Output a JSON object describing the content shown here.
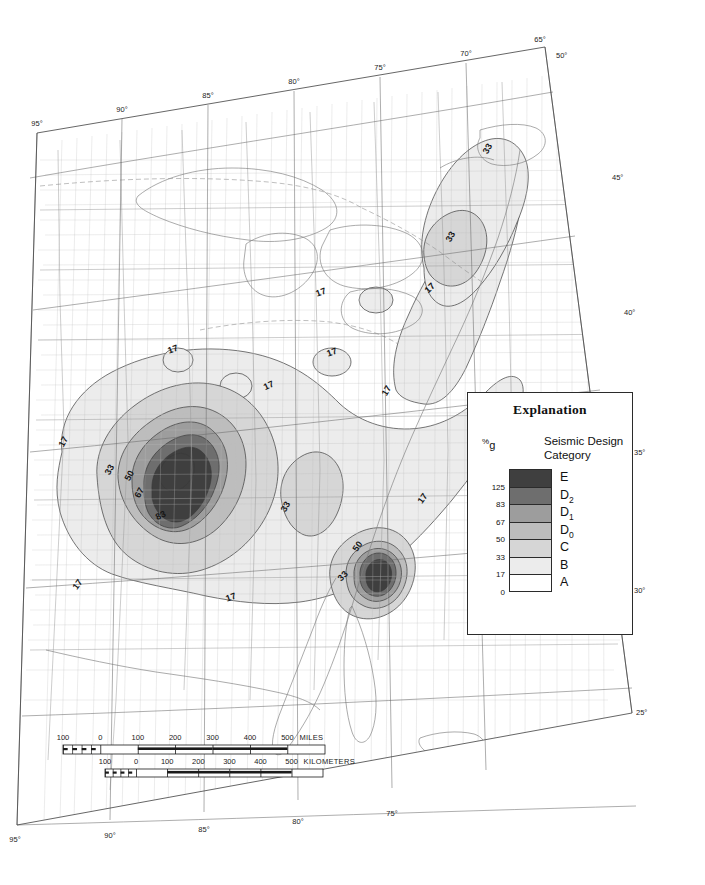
{
  "document": {
    "kind": "seismic-hazard-map",
    "region": "Central and Eastern United States"
  },
  "legend": {
    "title": "Explanation",
    "unit_label_pct": "%",
    "unit_label_g": "g",
    "header_line1": "Seismic Design",
    "header_line2": "Category",
    "entries": [
      {
        "category": "E",
        "sub": "",
        "upper": "",
        "lower": "125",
        "color": "#3f3f3f"
      },
      {
        "category": "D",
        "sub": "2",
        "upper": "125",
        "lower": "83",
        "color": "#6e6e6e"
      },
      {
        "category": "D",
        "sub": "1",
        "upper": "83",
        "lower": "67",
        "color": "#9d9d9d"
      },
      {
        "category": "D",
        "sub": "0",
        "upper": "67",
        "lower": "50",
        "color": "#bdbdbd"
      },
      {
        "category": "C",
        "sub": "",
        "upper": "50",
        "lower": "33",
        "color": "#d6d6d6"
      },
      {
        "category": "B",
        "sub": "",
        "upper": "33",
        "lower": "17",
        "color": "#ececec"
      },
      {
        "category": "A",
        "sub": "",
        "upper": "17",
        "lower": "0",
        "color": "#ffffff"
      }
    ],
    "tick_values": [
      "125",
      "83",
      "67",
      "50",
      "33",
      "17",
      "0"
    ]
  },
  "scale_bars": [
    {
      "unit": "MILES",
      "labels": [
        "100",
        "0",
        "100",
        "200",
        "300",
        "400",
        "500"
      ]
    },
    {
      "unit": "KILOMETERS",
      "labels": [
        "100",
        "0",
        "100",
        "200",
        "300",
        "400",
        "500"
      ]
    }
  ],
  "graticule": {
    "longitude_labels_top": [
      "95°",
      "90°",
      "85°",
      "80°",
      "75°",
      "70°",
      "65°"
    ],
    "longitude_labels_bottom": [
      "95°",
      "90°",
      "85°",
      "80°",
      "75°"
    ],
    "latitude_labels_right": [
      "50°",
      "45°",
      "40°",
      "35°",
      "30°",
      "25°"
    ]
  },
  "contour_labels": [
    {
      "value": "17",
      "x": 174,
      "y": 352,
      "rot": -20
    },
    {
      "value": "17",
      "x": 333,
      "y": 355,
      "rot": -20
    },
    {
      "value": "17",
      "x": 322,
      "y": 295,
      "rot": -20
    },
    {
      "value": "17",
      "x": 270,
      "y": 388,
      "rot": -25
    },
    {
      "value": "17",
      "x": 389,
      "y": 392,
      "rot": -60
    },
    {
      "value": "17",
      "x": 66,
      "y": 443,
      "rot": -62
    },
    {
      "value": "17",
      "x": 425,
      "y": 500,
      "rot": -55
    },
    {
      "value": "17",
      "x": 80,
      "y": 586,
      "rot": -55
    },
    {
      "value": "17",
      "x": 232,
      "y": 600,
      "rot": -20
    },
    {
      "value": "17",
      "x": 432,
      "y": 290,
      "rot": -45
    },
    {
      "value": "33",
      "x": 112,
      "y": 471,
      "rot": -60
    },
    {
      "value": "33",
      "x": 288,
      "y": 508,
      "rot": -60
    },
    {
      "value": "33",
      "x": 345,
      "y": 578,
      "rot": -45
    },
    {
      "value": "33",
      "x": 453,
      "y": 238,
      "rot": -60
    },
    {
      "value": "33",
      "x": 490,
      "y": 150,
      "rot": -60
    },
    {
      "value": "50",
      "x": 132,
      "y": 477,
      "rot": -62
    },
    {
      "value": "50",
      "x": 360,
      "y": 548,
      "rot": -55
    },
    {
      "value": "67",
      "x": 142,
      "y": 494,
      "rot": -62
    },
    {
      "value": "83",
      "x": 162,
      "y": 518,
      "rot": -25
    }
  ]
}
